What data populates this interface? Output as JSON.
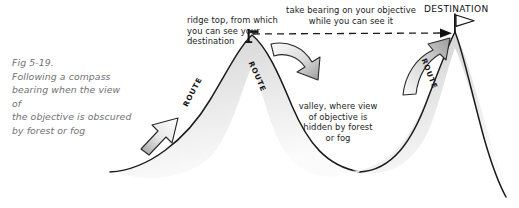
{
  "figure": {
    "number": "Fig 5-19.",
    "caption_lines": [
      "Following a compass",
      "bearing when the view of",
      "the objective is obscured",
      "by forest or fog"
    ]
  },
  "annotations": {
    "ridge_top": {
      "lines": [
        "ridge top, from which",
        "you can see your",
        "destination"
      ]
    },
    "take_bearing": {
      "lines": [
        "take bearing on your objective",
        "while you can see it"
      ]
    },
    "valley": {
      "lines": [
        "valley, where view",
        "of objective is",
        "hidden by forest",
        "or fog"
      ]
    },
    "destination_label": "DESTINATION"
  },
  "route_labels": [
    "ROUTE",
    "ROUTE",
    "ROUTE"
  ],
  "icons": {
    "ridge_marker": "survey-post-icon",
    "destination_flag": "flag-icon",
    "bearing_line": "dashed-arrow-icon",
    "arrow_ascend": "block-arrow-up-right-icon",
    "arrow_descend": "curved-arrow-down-right-icon",
    "arrow_climb": "curved-arrow-up-right-icon"
  },
  "colors": {
    "background": "#ffffff",
    "terrain_outline": "#1b1b1b",
    "terrain_fill_light": "#f2f2f2",
    "terrain_fill_dark": "#c9c9c9",
    "arrow_fill_light": "#f4f4f4",
    "arrow_fill_dark": "#a8a8a8",
    "arrow_outline": "#2a2a2a",
    "caption_text": "#6f6f74",
    "annotation_text": "#1c1c1c",
    "dashed_line": "#1b1b1b"
  }
}
